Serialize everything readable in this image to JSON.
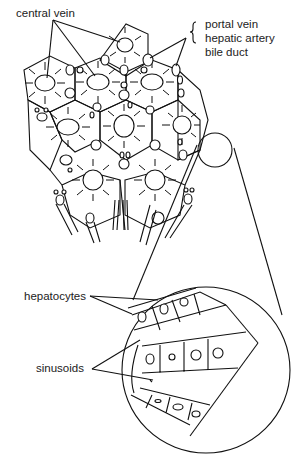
{
  "diagram": {
    "labels": {
      "central_vein": "central vein",
      "portal_vein": "portal vein",
      "hepatic_artery": "hepatic artery",
      "bile_duct": "bile duct",
      "hepatocytes": "hepatocytes",
      "sinusoids": "sinusoids"
    },
    "colors": {
      "line": "#111111",
      "text": "#222222",
      "background": "#ffffff"
    }
  }
}
